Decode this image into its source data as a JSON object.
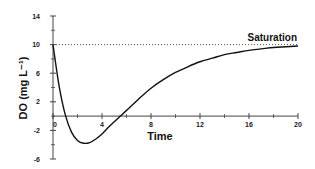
{
  "chart_data": {
    "type": "line",
    "title": "",
    "xlabel": "Time",
    "ylabel": "DO (mg L⁻¹)",
    "xlim": [
      0,
      20
    ],
    "ylim": [
      -6,
      14
    ],
    "x_ticks": [
      0,
      4,
      8,
      12,
      16,
      20
    ],
    "x_minor_ticks": [
      2,
      6,
      10,
      14,
      18
    ],
    "y_ticks": [
      14,
      10,
      6,
      2,
      -2,
      -6
    ],
    "y_minor_ticks": [
      12,
      8,
      4,
      0,
      -4
    ],
    "grid": false,
    "legend": null,
    "series": [
      {
        "name": "DO",
        "style": "solid",
        "color": "#111111",
        "x": [
          0,
          0.5,
          1,
          1.5,
          2,
          2.5,
          3,
          3.5,
          4,
          4.5,
          5,
          5.5,
          6,
          7,
          8,
          9,
          10,
          11,
          12,
          13,
          14,
          15,
          16,
          17,
          18,
          19,
          20
        ],
        "y": [
          10,
          4.2,
          0.2,
          -2.2,
          -3.4,
          -3.8,
          -3.7,
          -3.2,
          -2.5,
          -1.6,
          -0.8,
          0.0,
          0.8,
          2.4,
          3.9,
          5.1,
          6.1,
          6.9,
          7.6,
          8.1,
          8.6,
          8.9,
          9.2,
          9.4,
          9.6,
          9.7,
          9.8
        ]
      },
      {
        "name": "Saturation",
        "style": "dotted",
        "color": "#555555",
        "x": [
          0,
          20
        ],
        "y": [
          10,
          10
        ]
      }
    ],
    "annotations": [
      {
        "text": "Saturation",
        "x": 20,
        "y": 10,
        "anchor": "end-above"
      }
    ]
  },
  "labels": {
    "xlabel": "Time",
    "ylabel": "DO (mg L⁻¹)",
    "saturation": "Saturation"
  }
}
